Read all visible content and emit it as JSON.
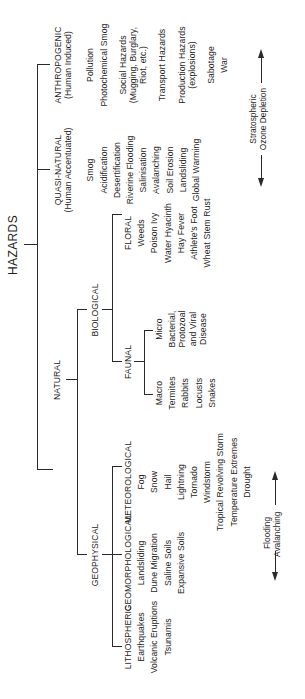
{
  "diagram": {
    "root": "HAZARDS",
    "categories": {
      "natural": {
        "label": "NATURAL",
        "geophysical": {
          "label": "GEOPHYSICAL",
          "lithospheric": {
            "label": "LITHOSPHERIC",
            "items": [
              "Earthquakes",
              "Volcanic Eruptions",
              "Tsunamis"
            ]
          },
          "geomorphological": {
            "label": "GEOMORPHOLOGICAL",
            "items": [
              "Landsliding",
              "Dune Migration",
              "Saline Soils",
              "Expansive Soils"
            ]
          },
          "meteorological": {
            "label": "METEOROLOGICAL",
            "items": [
              "Fog",
              "Snow",
              "Hail",
              "Lightning",
              "Tornado",
              "Windstorm",
              "Tropical Revolving Storm",
              "Temperature Extremes",
              "Drought"
            ]
          }
        },
        "biological": {
          "label": "BIOLOGICAL",
          "faunal": {
            "label": "FAUNAL",
            "macro": {
              "label": "Macro",
              "items": [
                "Termites",
                "Rabbits",
                "Locusts",
                "Snakes"
              ]
            },
            "micro": {
              "label": "Micro",
              "items": [
                "Bacterial,",
                "Protozoal",
                "and Viral",
                "Disease"
              ]
            }
          },
          "floral": {
            "label": "FLORAL",
            "items": [
              "Weeds",
              "Poison Ivy",
              "Water Hyacinth",
              "Hay Fever",
              "Athlete's Foot",
              "Wheat Stem Rust"
            ]
          }
        }
      },
      "quasi_natural": {
        "label": "QUASI-NATURAL",
        "sublabel": "(Human Accentuated)",
        "items": [
          "Smog",
          "Acidification",
          "Desertification",
          "Riverine Flooding",
          "Salinisation",
          "Avalanching",
          "Soil Erosion",
          "Landsliding",
          "Global Warming"
        ]
      },
      "anthropogenic": {
        "label": "ANTHROPOGENIC",
        "sublabel": "(Human Induced)",
        "items": [
          "Pollution",
          "Photochemical Smog",
          "Social Hazards",
          "(Mugging, Burglary,",
          "Riot, etc.)",
          "Transport Hazards",
          "Production Hazards",
          "(explosions)",
          "Sabotage",
          "War"
        ]
      }
    },
    "spectrum_arrows": {
      "natural_to_quasi": {
        "line1": "Flooding",
        "line2": "Avalanching"
      },
      "quasi_to_anthropogenic": {
        "line1": "Stratospheric",
        "line2": "Ozone Depletion"
      }
    }
  }
}
